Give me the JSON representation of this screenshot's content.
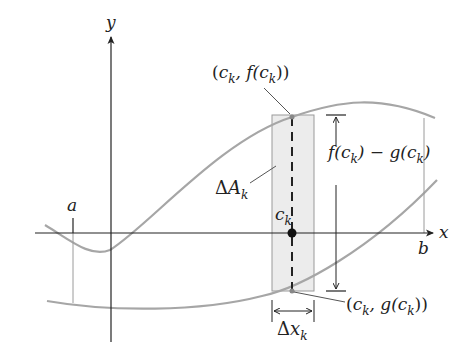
{
  "diagram": {
    "axes": {
      "x_label": "x",
      "y_label": "y"
    },
    "interval": {
      "a_label": "a",
      "b_label": "b"
    },
    "curves": [
      {
        "name": "f",
        "description": "upper curve"
      },
      {
        "name": "g",
        "description": "lower curve"
      }
    ],
    "rectangle": {
      "area_label_delta": "Δ",
      "area_label_var": "A",
      "area_label_sub": "k",
      "width_label_delta": "Δ",
      "width_label_var": "x",
      "width_label_sub": "k",
      "sample_point_var": "c",
      "sample_point_sub": "k",
      "fill_color": "#ececec",
      "edge_color": "#9a9a9a"
    },
    "annotations": {
      "top_point": {
        "open": "(",
        "c": "c",
        "sub": "k",
        "mid": ", f(",
        "c2": "c",
        "sub2": "k",
        "close": "))"
      },
      "bottom_point": {
        "open": "(",
        "c": "c",
        "sub": "k",
        "mid": ", g(",
        "c2": "c",
        "sub2": "k",
        "close": "))"
      },
      "height": {
        "p1": "f(",
        "c1": "c",
        "sub1": "k",
        "p2": ") − g(",
        "c2": "c",
        "sub2": "k",
        "p3": ")"
      }
    },
    "colors": {
      "curve": "#a6a6a6",
      "axis": "#222222",
      "guide": "#9a9a9a"
    }
  }
}
